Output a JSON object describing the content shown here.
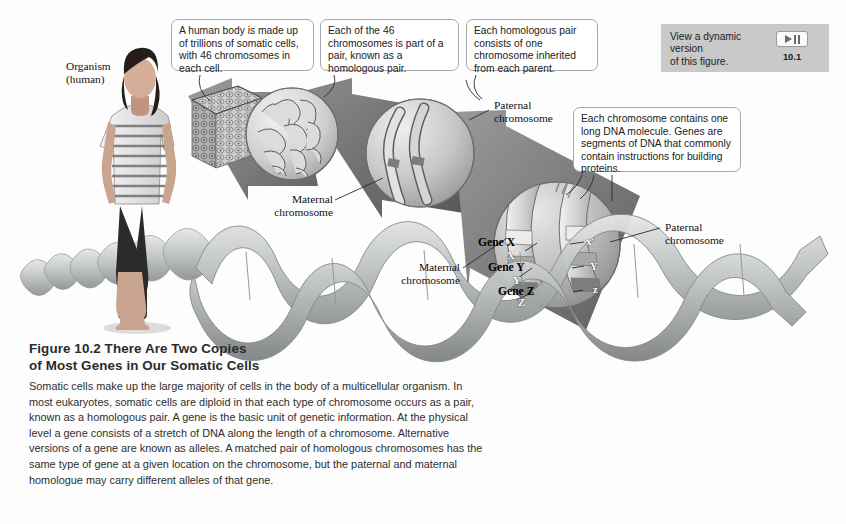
{
  "figure": {
    "number": "Figure 10.2",
    "title": "There Are Two Copies of Most Genes in Our Somatic Cells",
    "title_line1": "Figure 10.2  There Are Two Copies",
    "title_line2": "of Most Genes in Our Somatic Cells",
    "caption": "Somatic cells make up the large majority of cells in the body of a multicellular organism. In most eukaryotes, somatic cells are diploid in that each type of chromosome occurs as a pair, known as a homologous pair. A gene is the basic unit of genetic information. At the physical level a gene consists of a stretch of DNA along the length of a chromosome. Alternative versions of a gene are known as alleles. A matched pair of homologous chromosomes has the same type of gene at a given location on the chromosome, but the paternal and maternal homologue may carry different alleles of that gene."
  },
  "callouts": [
    {
      "id": "callout-somatic-cells",
      "text": "A human body is made up of trillions of somatic cells, with 46 chromosomes in each cell."
    },
    {
      "id": "callout-homologous-pair",
      "text": "Each of the 46 chromosomes is part of a pair, known as a homologous pair."
    },
    {
      "id": "callout-inheritance",
      "text": "Each homologous pair consists of one chromosome inherited from each parent."
    },
    {
      "id": "callout-dna-genes",
      "text": "Each chromosome contains one long DNA molecule. Genes are segments of DNA that commonly contain instructions for building proteins."
    }
  ],
  "labels": {
    "organism_line1": "Organism",
    "organism_line2": "(human)",
    "paternal_line1": "Paternal",
    "paternal_line2": "chromosome",
    "maternal_line1": "Maternal",
    "maternal_line2": "chromosome"
  },
  "genes": [
    {
      "name": "Gene X",
      "maternal_allele": "X",
      "paternal_allele": "x"
    },
    {
      "name": "Gene Y",
      "maternal_allele": "Y",
      "paternal_allele": "Y"
    },
    {
      "name": "Gene Z",
      "maternal_allele": "Z",
      "paternal_allele": "z"
    }
  ],
  "dynamic_version": {
    "text_line1": "View a dynamic version",
    "text_line2": "of this figure.",
    "number": "10.1",
    "play_icon": "play-icon",
    "pause_icon": "pause-icon"
  },
  "colors": {
    "background": "#fdfdfd",
    "arrow_dark": "#5b5b5b",
    "arrow_mid": "#8e8e8e",
    "arrow_light": "#b5b5b5",
    "callout_border": "#a9a9a9",
    "widget_bg": "#c9c9c9",
    "dna_ribbon": "#b9bcbd",
    "text": "#1b1b1b"
  }
}
